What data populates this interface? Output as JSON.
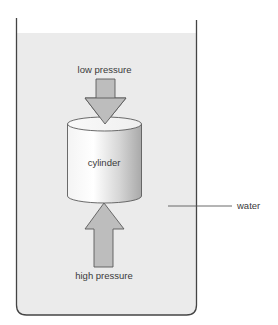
{
  "diagram": {
    "type": "physics-illustration",
    "labels": {
      "top_arrow": "low pressure",
      "bottom_arrow": "high pressure",
      "object": "cylinder",
      "fluid": "water"
    },
    "colors": {
      "water": "#ebebeb",
      "arrow_fill": "#bdbdbd",
      "arrow_stroke": "#5a5a5a",
      "container_stroke": "#444444",
      "cylinder_light": "#ffffff",
      "cylinder_dark": "#b5b5b5",
      "text": "#3a3a3a"
    },
    "elements": [
      {
        "id": "container",
        "kind": "open-top tank with rounded bottom corners"
      },
      {
        "id": "water",
        "kind": "fluid fill below surface line"
      },
      {
        "id": "cylinder",
        "kind": "submerged solid cylinder",
        "label": "cylinder"
      },
      {
        "id": "arrow-down",
        "kind": "arrow pointing down onto cylinder top",
        "label": "low pressure",
        "size": "small"
      },
      {
        "id": "arrow-up",
        "kind": "arrow pointing up onto cylinder bottom",
        "label": "high pressure",
        "size": "large"
      },
      {
        "id": "water-leader",
        "kind": "leader line to label",
        "label": "water"
      }
    ]
  }
}
